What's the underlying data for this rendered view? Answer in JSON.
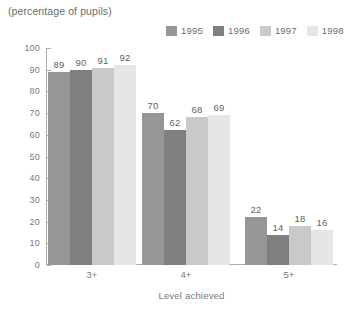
{
  "header": {
    "clipped_title": "(cut off title)",
    "subtitle": "(percentage of pupils)"
  },
  "axis_title": "Level achieved",
  "colors": {
    "series_1995": "#969696",
    "series_1996": "#7f7f7f",
    "series_1997": "#c9c9c9",
    "series_1998": "#e6e6e6",
    "axis": "#adadad",
    "text": "#6e6e6e"
  },
  "chart_data": {
    "type": "bar",
    "title": "",
    "subtitle": "(percentage of pupils)",
    "xlabel": "Level achieved",
    "ylabel": "",
    "ylim": [
      0,
      100
    ],
    "yticks": [
      0,
      10,
      20,
      30,
      40,
      50,
      60,
      70,
      80,
      90,
      100
    ],
    "grid": false,
    "legend_position": "top-right",
    "categories": [
      "3+",
      "4+",
      "5+"
    ],
    "series": [
      {
        "name": "1995",
        "color": "#969696",
        "values": [
          89,
          70,
          22
        ]
      },
      {
        "name": "1996",
        "color": "#7f7f7f",
        "values": [
          90,
          62,
          14
        ]
      },
      {
        "name": "1997",
        "color": "#c9c9c9",
        "values": [
          91,
          68,
          18
        ]
      },
      {
        "name": "1998",
        "color": "#e6e6e6",
        "values": [
          92,
          69,
          16
        ]
      }
    ]
  }
}
